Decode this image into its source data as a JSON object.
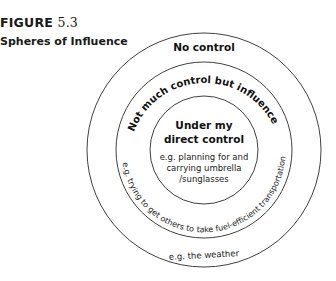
{
  "figure": {
    "label_word": "FIGURE",
    "label_number": "5.3",
    "title": "Spheres of Influence"
  },
  "diagram": {
    "type": "concentric-circles",
    "rings": [
      {
        "name": "outer",
        "heading": "No control",
        "example": "e.g. the weather"
      },
      {
        "name": "middle",
        "heading": "Not much control but influence",
        "example": "e.g. trying to get others to take fuel-efficient transportation"
      },
      {
        "name": "inner",
        "heading_line1": "Under my",
        "heading_line2": "direct control",
        "example_line1": "e.g. planning for and",
        "example_line2": "carrying umbrella",
        "example_line3": "/sunglasses"
      }
    ],
    "stroke_color": "#2a2a2a",
    "text_color": "#1a1a1a"
  }
}
